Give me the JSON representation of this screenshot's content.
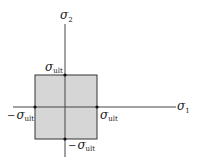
{
  "diagram": {
    "type": "failure-envelope",
    "colors": {
      "fill": "#d6d6d6",
      "stroke": "#333333",
      "axis": "#444444",
      "point": "#111111"
    },
    "axes": {
      "horizontal": {
        "symbol": "σ",
        "subscript": "1"
      },
      "vertical": {
        "symbol": "σ",
        "subscript": "2"
      }
    },
    "labels": {
      "top": {
        "prefix": "",
        "symbol": "σ",
        "subscript": "ult"
      },
      "right": {
        "prefix": "",
        "symbol": "σ",
        "subscript": "ult"
      },
      "left": {
        "prefix": "−",
        "symbol": "σ",
        "subscript": "ult"
      },
      "bottom": {
        "prefix": "−",
        "symbol": "σ",
        "subscript": "ult"
      }
    }
  }
}
